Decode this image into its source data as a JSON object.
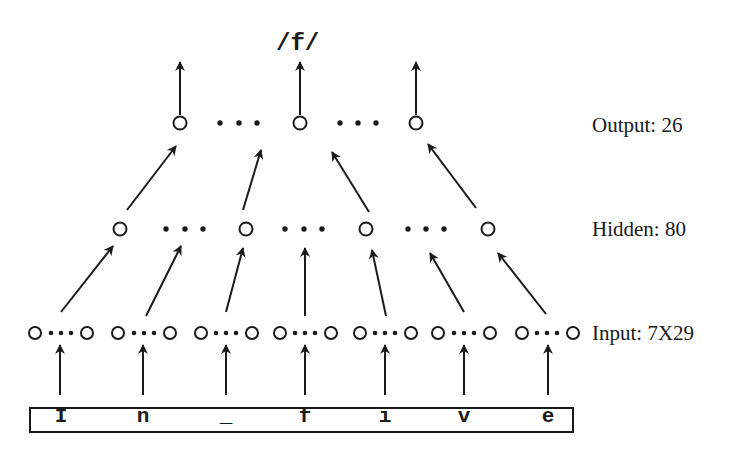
{
  "diagram": {
    "output_phoneme": "/f/",
    "layers": {
      "output": {
        "label": "Output: 26"
      },
      "hidden": {
        "label": "Hidden: 80"
      },
      "input": {
        "label": "Input: 7X29"
      }
    },
    "input_window": {
      "characters": [
        "I",
        "n",
        "_",
        "f",
        "i",
        "v",
        "e"
      ]
    },
    "colors": {
      "ink": "#1a1a1a",
      "background": "#ffffff"
    }
  }
}
